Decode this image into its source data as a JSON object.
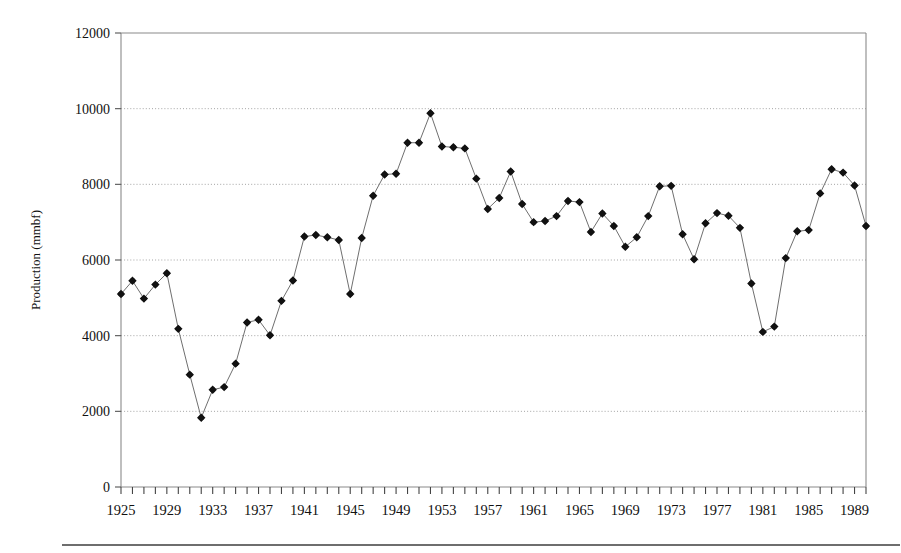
{
  "chart_data": {
    "type": "line",
    "title": "",
    "xlabel": "",
    "ylabel": "Production (mmbf)",
    "xlim": [
      1925,
      1990
    ],
    "ylim": [
      0,
      12000
    ],
    "grid": true,
    "legend": "none",
    "y_ticks": [
      0,
      2000,
      4000,
      6000,
      8000,
      10000,
      12000
    ],
    "y_tick_labels": [
      "0",
      "2000",
      "4000",
      "6000",
      "8000",
      "10000",
      "12000"
    ],
    "x_tick_labels": [
      "1925",
      "1929",
      "1933",
      "1937",
      "1941",
      "1945",
      "1949",
      "1953",
      "1957",
      "1961",
      "1965",
      "1969",
      "1973",
      "1977",
      "1981",
      "1985",
      "1989"
    ],
    "x_tick_label_years": [
      1925,
      1929,
      1933,
      1937,
      1941,
      1945,
      1949,
      1953,
      1957,
      1961,
      1965,
      1969,
      1973,
      1977,
      1981,
      1985,
      1989
    ],
    "x_minor_tick_years": [
      1925,
      1926,
      1927,
      1928,
      1929,
      1930,
      1931,
      1932,
      1933,
      1934,
      1935,
      1936,
      1937,
      1938,
      1939,
      1940,
      1941,
      1942,
      1943,
      1944,
      1945,
      1946,
      1947,
      1948,
      1949,
      1950,
      1951,
      1952,
      1953,
      1954,
      1955,
      1956,
      1957,
      1958,
      1959,
      1960,
      1961,
      1962,
      1963,
      1964,
      1965,
      1966,
      1967,
      1968,
      1969,
      1970,
      1971,
      1972,
      1973,
      1974,
      1975,
      1976,
      1977,
      1978,
      1979,
      1980,
      1981,
      1982,
      1983,
      1984,
      1985,
      1986,
      1987,
      1988,
      1989,
      1990
    ],
    "x": [
      1925,
      1926,
      1927,
      1928,
      1929,
      1930,
      1931,
      1932,
      1933,
      1934,
      1935,
      1936,
      1937,
      1938,
      1939,
      1940,
      1941,
      1942,
      1943,
      1944,
      1945,
      1946,
      1947,
      1948,
      1949,
      1950,
      1951,
      1952,
      1953,
      1954,
      1955,
      1956,
      1957,
      1958,
      1959,
      1960,
      1961,
      1962,
      1963,
      1964,
      1965,
      1966,
      1967,
      1968,
      1969,
      1970,
      1971,
      1972,
      1973,
      1974,
      1975,
      1976,
      1977,
      1978,
      1979,
      1980,
      1981,
      1982,
      1983,
      1984,
      1985,
      1986,
      1987,
      1988,
      1989,
      1990
    ],
    "values": [
      5100,
      5450,
      4980,
      5350,
      5650,
      4180,
      2970,
      1830,
      2570,
      2640,
      3260,
      4350,
      4420,
      4010,
      4920,
      5460,
      6620,
      6660,
      6600,
      6530,
      5100,
      6580,
      7700,
      8260,
      8280,
      9100,
      9100,
      9880,
      9000,
      8980,
      8950,
      8150,
      7350,
      7640,
      8340,
      7480,
      7000,
      7030,
      7160,
      7560,
      7530,
      6740,
      7230,
      6900,
      6350,
      6600,
      7160,
      7950,
      7960,
      6680,
      6020,
      6970,
      7240,
      7170,
      6850,
      5380,
      4100,
      4240,
      6050,
      6760,
      6790,
      7760,
      8400,
      8310,
      7970,
      6900
    ],
    "series": [
      {
        "name": "Production",
        "marker": "filled-diamond-circle",
        "line_color": "#6f6f6f",
        "marker_color": "#111111"
      }
    ]
  },
  "axes": {
    "y_label": "Production (mmbf)"
  }
}
